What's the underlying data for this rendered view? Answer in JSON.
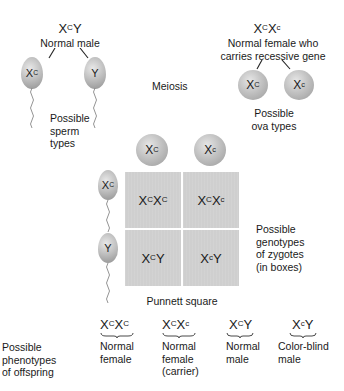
{
  "male_parent": {
    "genotype": {
      "base1": "X",
      "sup1": "C",
      "base2": "Y",
      "sup2": ""
    },
    "label": "Normal male"
  },
  "female_parent": {
    "genotype": {
      "base1": "X",
      "sup1": "C",
      "base2": "X",
      "sup2": "c"
    },
    "label_line1": "Normal female who",
    "label_line2": "carries recessive gene"
  },
  "meiosis_label": "Meiosis",
  "sperm": {
    "types": [
      {
        "base": "X",
        "sup": "C"
      },
      {
        "base": "Y",
        "sup": ""
      }
    ],
    "label_lines": [
      "Possible",
      "sperm",
      "types"
    ]
  },
  "ova": {
    "types": [
      {
        "base": "X",
        "sup": "C"
      },
      {
        "base": "X",
        "sup": "c"
      }
    ],
    "label_lines": [
      "Possible",
      "ova types"
    ]
  },
  "punnett": {
    "title": "Punnett square",
    "cells": [
      {
        "b1": "X",
        "s1": "C",
        "b2": "X",
        "s2": "C"
      },
      {
        "b1": "X",
        "s1": "C",
        "b2": "X",
        "s2": "c"
      },
      {
        "b1": "X",
        "s1": "C",
        "b2": "Y",
        "s2": ""
      },
      {
        "b1": "X",
        "s1": "c",
        "b2": "Y",
        "s2": ""
      }
    ],
    "side_label_lines": [
      "Possible",
      "genotypes",
      "of zygotes",
      "(in boxes)"
    ]
  },
  "phenotypes": {
    "label_lines": [
      "Possible",
      "phenotypes",
      "of offspring"
    ],
    "items": [
      {
        "b1": "X",
        "s1": "C",
        "b2": "X",
        "s2": "C",
        "lines": [
          "Normal",
          "female",
          ""
        ]
      },
      {
        "b1": "X",
        "s1": "C",
        "b2": "X",
        "s2": "c",
        "lines": [
          "Normal",
          "female",
          "(carrier)"
        ]
      },
      {
        "b1": "X",
        "s1": "C",
        "b2": "Y",
        "s2": "",
        "lines": [
          "Normal",
          "male",
          ""
        ]
      },
      {
        "b1": "X",
        "s1": "c",
        "b2": "Y",
        "s2": "",
        "lines": [
          "Color-blind",
          "male",
          ""
        ]
      }
    ]
  },
  "colors": {
    "cell_gray": "#cfcfcf",
    "ball_gray": "#bdbdbd",
    "text": "#1a1a1a"
  }
}
